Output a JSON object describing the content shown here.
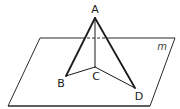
{
  "diagram": {
    "type": "geometry-3d",
    "plane": {
      "label": "m",
      "corners": [
        [
          40,
          38
        ],
        [
          175,
          38
        ],
        [
          150,
          106
        ],
        [
          8,
          106
        ]
      ],
      "hidden_segment": [
        [
          82,
          38
        ],
        [
          108,
          38
        ]
      ]
    },
    "points": {
      "A": {
        "label": "A",
        "x": 95,
        "y": 18,
        "label_x": 95,
        "label_y": 12
      },
      "B": {
        "label": "B",
        "x": 66,
        "y": 76,
        "label_x": 60,
        "label_y": 87
      },
      "C": {
        "label": "C",
        "x": 95,
        "y": 67,
        "label_x": 95,
        "label_y": 81
      },
      "D": {
        "label": "D",
        "x": 135,
        "y": 88,
        "label_x": 139,
        "label_y": 100
      }
    },
    "edges": [
      {
        "from": "A",
        "to": "B",
        "style": "bold"
      },
      {
        "from": "A",
        "to": "D",
        "style": "bold"
      },
      {
        "from": "A",
        "to": "C",
        "style": "thin"
      },
      {
        "from": "B",
        "to": "C",
        "style": "thin"
      },
      {
        "from": "C",
        "to": "D",
        "style": "thin"
      }
    ],
    "colors": {
      "line": "#1a1a1a",
      "plane": "#2a2a2a",
      "background": "#ffffff"
    }
  }
}
